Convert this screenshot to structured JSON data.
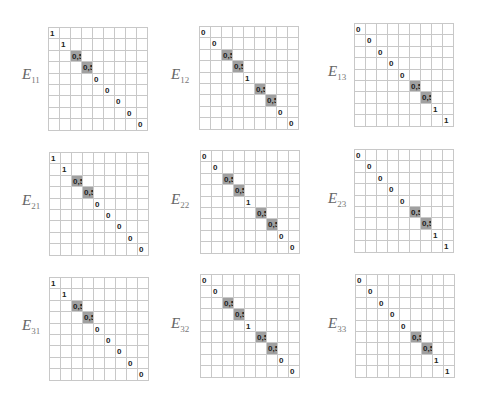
{
  "colors": {
    "highlight": "#a0a0a0",
    "grid_line": "#c8c8c8",
    "text": "#222222"
  },
  "matrices": [
    {
      "label": "E",
      "sub": "11",
      "x": 48,
      "y": 27,
      "lx": 22,
      "ly": 66,
      "diag": [
        "1",
        "1",
        "0,5",
        "0,5",
        "0",
        "0",
        "0",
        "0",
        "0"
      ]
    },
    {
      "label": "E",
      "sub": "12",
      "x": 199,
      "y": 26,
      "lx": 171,
      "ly": 66,
      "diag": [
        "0",
        "0",
        "0,5",
        "0,5",
        "1",
        "0,5",
        "0,5",
        "0",
        "0"
      ]
    },
    {
      "label": "E",
      "sub": "13",
      "x": 354,
      "y": 23,
      "lx": 328,
      "ly": 63,
      "diag": [
        "0",
        "0",
        "0",
        "0",
        "0",
        "0,5",
        "0,5",
        "1",
        "1"
      ]
    },
    {
      "label": "E",
      "sub": "21",
      "x": 49,
      "y": 152,
      "lx": 22,
      "ly": 192,
      "diag": [
        "1",
        "1",
        "0,5",
        "0,5",
        "0",
        "0",
        "0",
        "0",
        "0"
      ]
    },
    {
      "label": "E",
      "sub": "22",
      "x": 200,
      "y": 150,
      "lx": 171,
      "ly": 191,
      "diag": [
        "0",
        "0",
        "0,5",
        "0,5",
        "1",
        "0,5",
        "0,5",
        "0",
        "0"
      ]
    },
    {
      "label": "E",
      "sub": "23",
      "x": 354,
      "y": 149,
      "lx": 328,
      "ly": 190,
      "diag": [
        "0",
        "0",
        "0",
        "0",
        "0",
        "0,5",
        "0,5",
        "1",
        "1"
      ]
    },
    {
      "label": "E",
      "sub": "31",
      "x": 49,
      "y": 277,
      "lx": 22,
      "ly": 317,
      "diag": [
        "1",
        "1",
        "0,5",
        "0,5",
        "0",
        "0",
        "0",
        "0",
        "0"
      ]
    },
    {
      "label": "E",
      "sub": "32",
      "x": 200,
      "y": 274,
      "lx": 171,
      "ly": 315,
      "diag": [
        "0",
        "0",
        "0,5",
        "0,5",
        "1",
        "0,5",
        "0,5",
        "0",
        "0"
      ]
    },
    {
      "label": "E",
      "sub": "33",
      "x": 355,
      "y": 274,
      "lx": 328,
      "ly": 315,
      "diag": [
        "0",
        "0",
        "0",
        "0",
        "0",
        "0,5",
        "0,5",
        "1",
        "1"
      ]
    }
  ]
}
